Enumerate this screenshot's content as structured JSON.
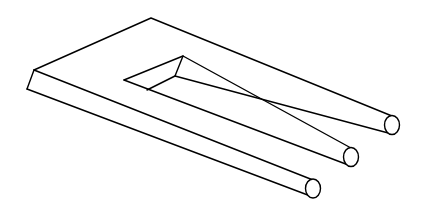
{
  "figure": {
    "line_color": "#000000",
    "background_color": "#ffffff",
    "prong_count": 3
  }
}
